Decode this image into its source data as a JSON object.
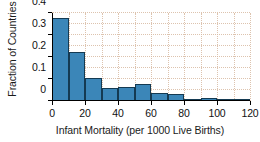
{
  "chart_data": {
    "type": "bar",
    "title": "",
    "subtitle": "",
    "xlabel": "Infant Mortality (per 1000 Live Births)",
    "ylabel": "Fraction of Countries",
    "xlim": [
      0,
      120
    ],
    "ylim": [
      0,
      0.4
    ],
    "grid": true,
    "legend": "none",
    "bin_width": 10,
    "bar_color": "#3b86b8",
    "bar_edge_color": "#143a52",
    "grid_color": "#d8b9a0",
    "axis_color": "#000000",
    "xticks": [
      0,
      20,
      40,
      60,
      80,
      100,
      120
    ],
    "xtick_labels": [
      "0",
      "20",
      "40",
      "60",
      "80",
      "100",
      "120"
    ],
    "yticks": [
      0,
      0.1,
      0.2,
      0.3,
      0.4
    ],
    "ytick_labels": [
      "0",
      "0.1",
      "0.2",
      "0.3",
      "0.4"
    ],
    "bin_edges": [
      0,
      10,
      20,
      30,
      40,
      50,
      60,
      70,
      80,
      90,
      100,
      110,
      120
    ],
    "categories": [
      "0-10",
      "10-20",
      "20-30",
      "30-40",
      "40-50",
      "50-60",
      "60-70",
      "70-80",
      "80-90",
      "90-100",
      "100-110",
      "110-120"
    ],
    "values": [
      0.377,
      0.223,
      0.105,
      0.058,
      0.062,
      0.077,
      0.036,
      0.032,
      0.005,
      0.014,
      0.009,
      0.005
    ]
  }
}
